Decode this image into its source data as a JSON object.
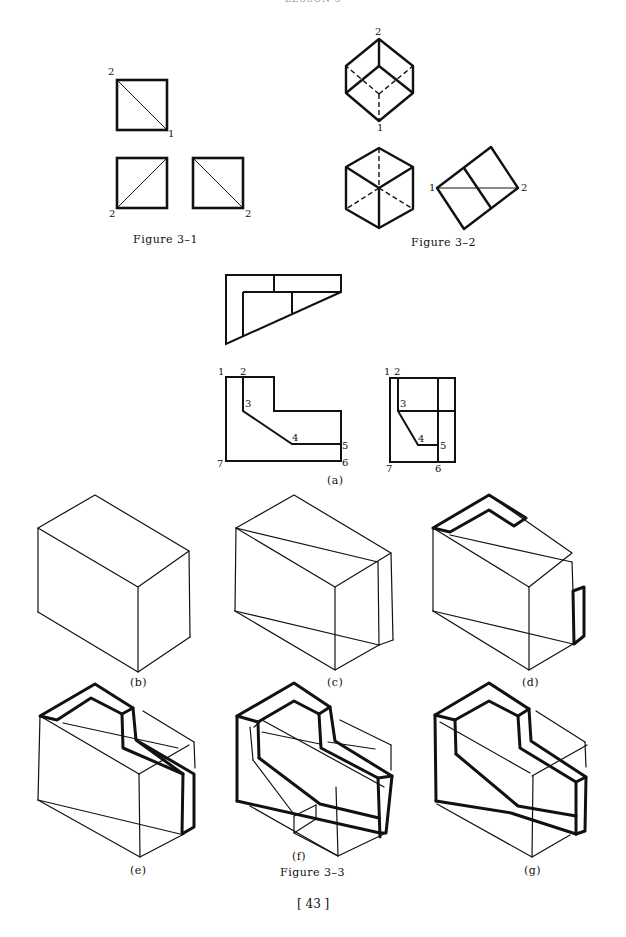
{
  "page": {
    "header": "LESSON 3",
    "page_number": "[ 43 ]"
  },
  "figure_3_1": {
    "caption": "Figure 3–1",
    "labels": {
      "top_a": "2",
      "top_b": "1",
      "bl": "2",
      "br": "2"
    }
  },
  "figure_3_2": {
    "caption": "Figure 3–2",
    "labels": {
      "cube_top": "2",
      "cube_bottom": "1",
      "rect_left": "1",
      "rect_right": "2"
    }
  },
  "figure_3_3": {
    "caption": "Figure 3–3",
    "view_a": {
      "caption": "(a)",
      "front_labels": [
        "1",
        "2",
        "3",
        "4",
        "5",
        "6",
        "7"
      ],
      "side_labels": [
        "1",
        "2",
        "3",
        "4",
        "5",
        "6",
        "7"
      ]
    },
    "subfigures": [
      {
        "id": "b",
        "caption": "(b)"
      },
      {
        "id": "c",
        "caption": "(c)"
      },
      {
        "id": "d",
        "caption": "(d)"
      },
      {
        "id": "e",
        "caption": "(e)"
      },
      {
        "id": "f",
        "caption": "(f)"
      },
      {
        "id": "g",
        "caption": "(g)"
      }
    ]
  }
}
